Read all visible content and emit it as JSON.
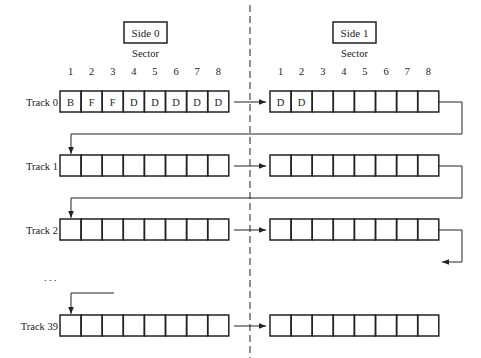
{
  "sides": [
    {
      "label": "Side 0",
      "sector_title": "Sector",
      "sector_numbers": [
        "1",
        "2",
        "3",
        "4",
        "5",
        "6",
        "7",
        "8"
      ]
    },
    {
      "label": "Side 1",
      "sector_title": "Sector",
      "sector_numbers": [
        "1",
        "2",
        "3",
        "4",
        "5",
        "6",
        "7",
        "8"
      ]
    }
  ],
  "tracks": [
    {
      "label": "Track 0",
      "side0": [
        "B",
        "F",
        "F",
        "D",
        "D",
        "D",
        "D",
        "D"
      ],
      "side1": [
        "D",
        "D",
        "",
        "",
        "",
        "",
        "",
        ""
      ]
    },
    {
      "label": "Track 1",
      "side0": [
        "",
        "",
        "",
        "",
        "",
        "",
        "",
        ""
      ],
      "side1": [
        "",
        "",
        "",
        "",
        "",
        "",
        "",
        ""
      ]
    },
    {
      "label": "Track 2",
      "side0": [
        "",
        "",
        "",
        "",
        "",
        "",
        "",
        ""
      ],
      "side1": [
        "",
        "",
        "",
        "",
        "",
        "",
        "",
        ""
      ]
    },
    {
      "label": "Track 39",
      "side0": [
        "",
        "",
        "",
        "",
        "",
        "",
        "",
        ""
      ],
      "side1": [
        "",
        "",
        "",
        "",
        "",
        "",
        "",
        ""
      ]
    }
  ],
  "ellipsis": ". . .",
  "colors": {
    "stroke": "#222222",
    "divider": "#555555"
  }
}
